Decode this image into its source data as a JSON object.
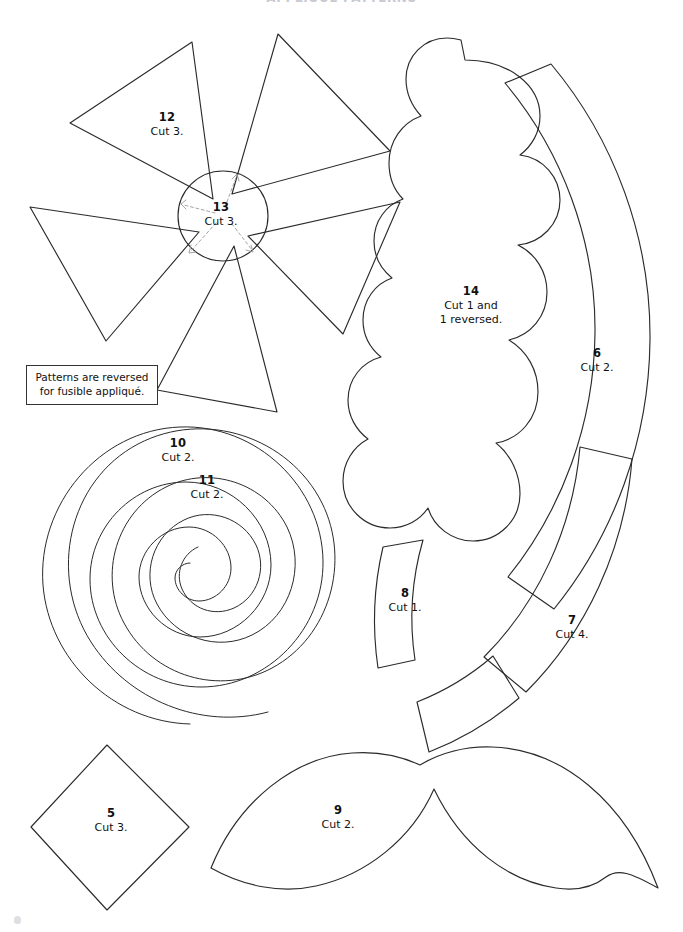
{
  "page": {
    "heading": "APPLIQUÉ PATTERNS",
    "width": 683,
    "height": 932,
    "background_color": "#ffffff",
    "line_color": "#2b2b2b",
    "guide_color": "#9a9a9a"
  },
  "note": {
    "name": "fusible-applique-note",
    "line1": "Patterns are reversed",
    "line2": "for fusible appliqué."
  },
  "pieces": [
    {
      "id": "piece-5",
      "number": "5",
      "cut_line1": "Cut 3.",
      "cut_line2": "",
      "shape": "diamond",
      "label_x": 111,
      "label_y": 806
    },
    {
      "id": "piece-6",
      "number": "6",
      "cut_line1": "Cut 2.",
      "cut_line2": "",
      "shape": "outer-arc-band",
      "label_x": 597,
      "label_y": 346
    },
    {
      "id": "piece-7",
      "number": "7",
      "cut_line1": "Cut 4.",
      "cut_line2": "",
      "shape": "inner-arc-band",
      "label_x": 572,
      "label_y": 613
    },
    {
      "id": "piece-8",
      "number": "8",
      "cut_line1": "Cut 1.",
      "cut_line2": "",
      "shape": "small-curved-band",
      "label_x": 405,
      "label_y": 586
    },
    {
      "id": "piece-9",
      "number": "9",
      "cut_line1": "Cut 2.",
      "cut_line2": "",
      "shape": "double-leaf",
      "label_x": 338,
      "label_y": 803
    },
    {
      "id": "piece-10",
      "number": "10",
      "cut_line1": "Cut 2.",
      "cut_line2": "",
      "shape": "outer-spiral",
      "label_x": 178,
      "label_y": 436
    },
    {
      "id": "piece-11",
      "number": "11",
      "cut_line1": "Cut 2.",
      "cut_line2": "",
      "shape": "inner-spiral",
      "label_x": 207,
      "label_y": 473
    },
    {
      "id": "piece-12",
      "number": "12",
      "cut_line1": "Cut 3.",
      "cut_line2": "",
      "shape": "pinwheel-petal",
      "label_x": 167,
      "label_y": 110
    },
    {
      "id": "piece-13",
      "number": "13",
      "cut_line1": "Cut 3.",
      "cut_line2": "",
      "shape": "center-circle",
      "label_x": 221,
      "label_y": 200
    },
    {
      "id": "piece-14",
      "number": "14",
      "cut_line1": "Cut 1 and",
      "cut_line2": "1 reversed.",
      "shape": "scalloped-cloud",
      "label_x": 471,
      "label_y": 284
    }
  ]
}
